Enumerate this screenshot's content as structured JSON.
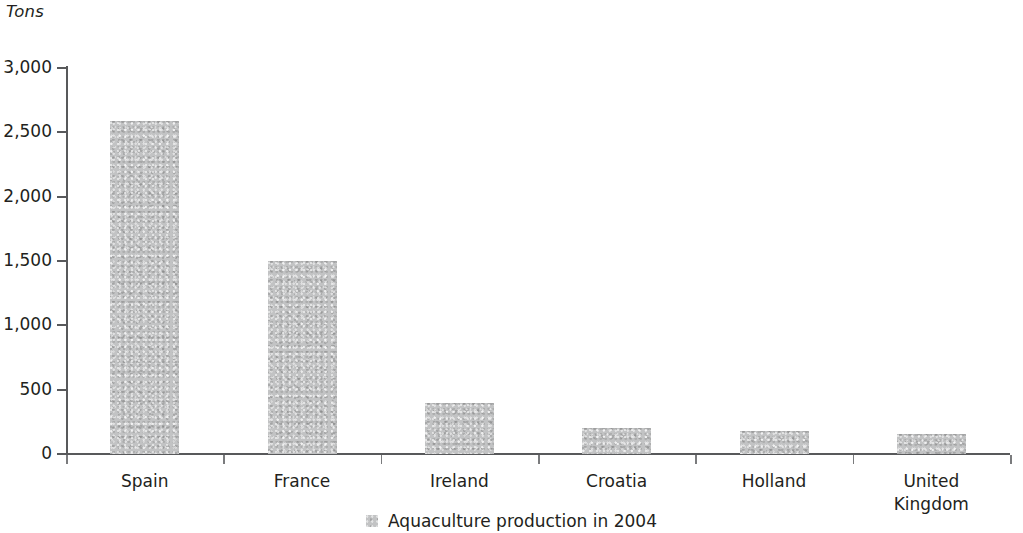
{
  "chart_data": {
    "type": "bar",
    "title": "",
    "subtitle": "",
    "xlabel": "",
    "ylabel": "Tons",
    "ylim": [
      0,
      3000
    ],
    "grid": false,
    "legend_position": "bottom",
    "categories": [
      "Spain",
      "France",
      "Ireland",
      "Croatia",
      "Holland",
      "United\nKingdom"
    ],
    "ytick_labels": [
      "3,000",
      "2,500",
      "2,000",
      "1,500",
      "1,000",
      "500",
      "0"
    ],
    "ytick_values": [
      3000,
      2500,
      2000,
      1500,
      1000,
      500,
      0
    ],
    "series": [
      {
        "name": "Aquaculture production in 2004",
        "color": "#c2c3c4",
        "values": [
          2590,
          1500,
          400,
          205,
          180,
          155
        ]
      }
    ]
  },
  "legend": {
    "entries": [
      {
        "label": "Aquaculture production in 2004",
        "swatch_color": "#c2c3c4"
      }
    ]
  },
  "axis": {
    "unit_label": "Tons",
    "axis_color": "#58595b"
  }
}
